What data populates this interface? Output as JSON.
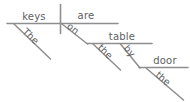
{
  "diagram": {
    "type": "reed-kellogg-sentence-diagram",
    "words": {
      "subject": "keys",
      "verb": "are",
      "subject_modifier": "The",
      "preposition_1": "on",
      "prep_object_1": "table",
      "prep_object_1_modifier": "the",
      "preposition_2": "by",
      "prep_object_2": "door",
      "prep_object_2_modifier": "the"
    },
    "colors": {
      "line": "#8e8e8e",
      "text": "#606060",
      "background": "#ffffff"
    }
  }
}
